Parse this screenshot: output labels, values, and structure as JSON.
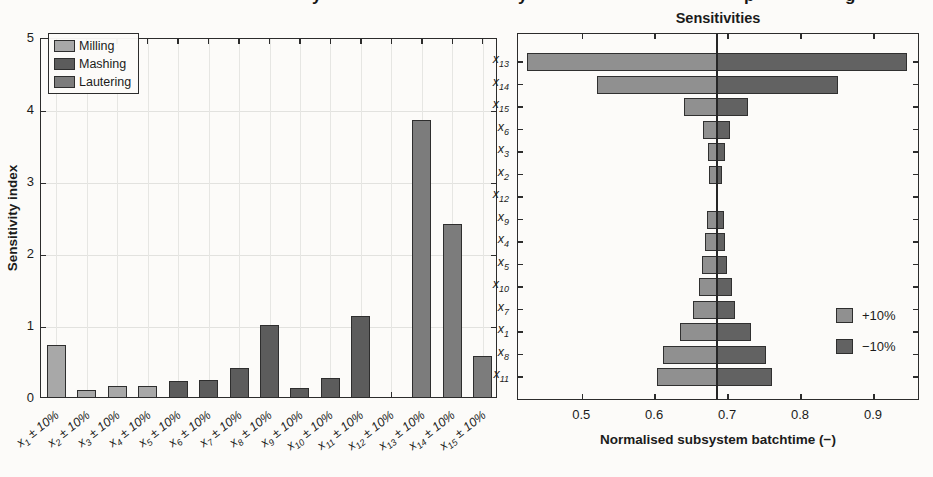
{
  "page": {
    "background": "#fcfbf9"
  },
  "top_fragments": [
    {
      "ch": "y",
      "x": 312
    },
    {
      "ch": "y",
      "x": 518
    },
    {
      "ch": "p",
      "x": 744
    },
    {
      "ch": "g",
      "x": 845
    }
  ],
  "chart_data": [
    {
      "type": "bar",
      "title": "",
      "ylabel": "Sensitivity index",
      "ylim": [
        0,
        5
      ],
      "yticks": [
        0,
        1,
        2,
        3,
        4,
        5
      ],
      "grid": true,
      "legend_position": "top-left",
      "legend": [
        {
          "label": "Milling",
          "color": "#a8a8a8"
        },
        {
          "label": "Mashing",
          "color": "#5c5c5c"
        },
        {
          "label": "Lautering",
          "color": "#7c7c7c"
        }
      ],
      "category_suffix": "± 10%",
      "bars": [
        {
          "var": "x",
          "sub": "1",
          "value": 0.72,
          "group": "Milling"
        },
        {
          "var": "x",
          "sub": "2",
          "value": 0.1,
          "group": "Milling"
        },
        {
          "var": "x",
          "sub": "3",
          "value": 0.15,
          "group": "Milling"
        },
        {
          "var": "x",
          "sub": "4",
          "value": 0.15,
          "group": "Milling"
        },
        {
          "var": "x",
          "sub": "5",
          "value": 0.22,
          "group": "Mashing"
        },
        {
          "var": "x",
          "sub": "6",
          "value": 0.23,
          "group": "Mashing"
        },
        {
          "var": "x",
          "sub": "7",
          "value": 0.4,
          "group": "Mashing"
        },
        {
          "var": "x",
          "sub": "8",
          "value": 1.0,
          "group": "Mashing"
        },
        {
          "var": "x",
          "sub": "9",
          "value": 0.12,
          "group": "Mashing"
        },
        {
          "var": "x",
          "sub": "10",
          "value": 0.27,
          "group": "Mashing"
        },
        {
          "var": "x",
          "sub": "11",
          "value": 1.12,
          "group": "Mashing"
        },
        {
          "var": "x",
          "sub": "12",
          "value": 0.0,
          "group": "Mashing"
        },
        {
          "var": "x",
          "sub": "13",
          "value": 3.85,
          "group": "Lautering"
        },
        {
          "var": "x",
          "sub": "14",
          "value": 2.4,
          "group": "Lautering"
        },
        {
          "var": "x",
          "sub": "15",
          "value": 0.57,
          "group": "Lautering"
        }
      ]
    },
    {
      "type": "bar",
      "orientation": "horizontal-tornado",
      "title": "Sensitivities",
      "xlabel": "Normalised subsystem batchtime (−)",
      "xlim": [
        0.412,
        0.963
      ],
      "xticks": [
        0.5,
        0.6,
        0.7,
        0.8,
        0.9
      ],
      "baseline": 0.685,
      "grid": false,
      "legend_position": "right-middle",
      "legend": [
        {
          "label": "+10%",
          "color": "#909090"
        },
        {
          "label": "−10%",
          "color": "#626262"
        }
      ],
      "rows": [
        {
          "var": "x",
          "sub": "13",
          "low": 0.425,
          "high": 0.945
        },
        {
          "var": "x",
          "sub": "14",
          "low": 0.52,
          "high": 0.85
        },
        {
          "var": "x",
          "sub": "15",
          "low": 0.64,
          "high": 0.727
        },
        {
          "var": "x",
          "sub": "6",
          "low": 0.665,
          "high": 0.702
        },
        {
          "var": "x",
          "sub": "3",
          "low": 0.672,
          "high": 0.696
        },
        {
          "var": "x",
          "sub": "2",
          "low": 0.674,
          "high": 0.691
        },
        {
          "var": "x",
          "sub": "12",
          "low": 0.684,
          "high": 0.686
        },
        {
          "var": "x",
          "sub": "9",
          "low": 0.671,
          "high": 0.694
        },
        {
          "var": "x",
          "sub": "4",
          "low": 0.668,
          "high": 0.696
        },
        {
          "var": "x",
          "sub": "5",
          "low": 0.664,
          "high": 0.699
        },
        {
          "var": "x",
          "sub": "10",
          "low": 0.66,
          "high": 0.705
        },
        {
          "var": "x",
          "sub": "7",
          "low": 0.652,
          "high": 0.71
        },
        {
          "var": "x",
          "sub": "1",
          "low": 0.634,
          "high": 0.731
        },
        {
          "var": "x",
          "sub": "8",
          "low": 0.611,
          "high": 0.752
        },
        {
          "var": "x",
          "sub": "11",
          "low": 0.602,
          "high": 0.76
        }
      ]
    }
  ]
}
